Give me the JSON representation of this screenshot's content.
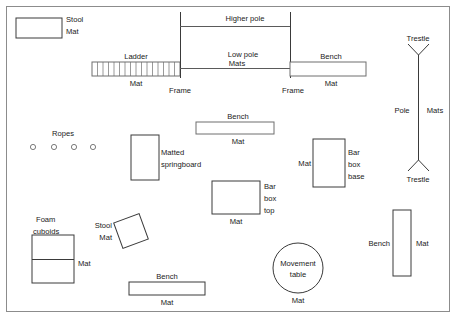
{
  "diagram": {
    "border": {
      "x": 6,
      "y": 6,
      "width": 444,
      "height": 306
    },
    "colors": {
      "outline_dark": "#3a3a3a",
      "outline_soft": "#6e6e6e",
      "border": "#8c8c8c",
      "text": "#1a1a1a",
      "background": "#ffffff"
    },
    "items": [
      {
        "id": "stool-mat-top-left",
        "shape": "rect",
        "labels": [
          "Stool",
          "Mat"
        ],
        "x": 16,
        "y": 18,
        "width": 46,
        "height": 20
      },
      {
        "id": "ladder",
        "shape": "ladder",
        "labels": [
          "Ladder",
          "Mat"
        ],
        "x": 92,
        "y": 62,
        "width": 88,
        "height": 14,
        "rungs": 16
      },
      {
        "id": "frame-left",
        "shape": "vline",
        "labels": [
          "Frame"
        ],
        "x": 180,
        "y1": 12,
        "y2": 76
      },
      {
        "id": "frame-right",
        "shape": "vline",
        "labels": [
          "Frame"
        ],
        "x": 290,
        "y1": 12,
        "y2": 76
      },
      {
        "id": "higher-pole",
        "shape": "hline",
        "labels": [
          "Higher pole"
        ],
        "x1": 180,
        "x2": 290,
        "y": 26
      },
      {
        "id": "low-pole",
        "shape": "hline",
        "labels": [
          "Low pole",
          "Mats"
        ],
        "x1": 180,
        "x2": 290,
        "y": 68
      },
      {
        "id": "bench-mat-top-right",
        "shape": "rect",
        "labels": [
          "Bench",
          "Mat"
        ],
        "x": 290,
        "y": 62,
        "width": 76,
        "height": 14
      },
      {
        "id": "trestle-pole-assembly",
        "shape": "pole-trestle",
        "labels": [
          "Trestle",
          "Pole",
          "Mats",
          "Trestle"
        ],
        "x": 418,
        "y1": 55,
        "y2": 160,
        "arm": 11
      },
      {
        "id": "ropes",
        "shape": "dots",
        "labels": [
          "Ropes"
        ],
        "y": 147,
        "dot_xs": [
          33,
          54,
          74,
          93
        ],
        "radius": 2.6
      },
      {
        "id": "bench-mat-middle",
        "shape": "rect",
        "labels": [
          "Bench",
          "Mat"
        ],
        "x": 196,
        "y": 122,
        "width": 78,
        "height": 12
      },
      {
        "id": "matted-springboard",
        "shape": "rect",
        "labels": [
          "Matted",
          "springboard"
        ],
        "x": 131,
        "y": 135,
        "width": 28,
        "height": 45
      },
      {
        "id": "bar-box-base",
        "shape": "rect",
        "labels": [
          "Mat",
          "Bar",
          "box",
          "base"
        ],
        "x": 313,
        "y": 139,
        "width": 32,
        "height": 48
      },
      {
        "id": "bar-box-top",
        "shape": "rect",
        "labels": [
          "Mat",
          "Bar",
          "box",
          "top"
        ],
        "x": 212,
        "y": 181,
        "width": 48,
        "height": 33
      },
      {
        "id": "foam-cuboids",
        "shape": "rect-split",
        "labels": [
          "Foam",
          "cuboids",
          "Mat"
        ],
        "x": 32,
        "y": 235,
        "width": 42,
        "height": 48,
        "split_y": 259
      },
      {
        "id": "stool-mat-rotated",
        "shape": "rect-rotated",
        "labels": [
          "Stool",
          "Mat"
        ],
        "cx": 131,
        "cy": 231,
        "width": 27,
        "height": 27,
        "rotation": -20
      },
      {
        "id": "bench-mat-bottom",
        "shape": "rect",
        "labels": [
          "Bench",
          "Mat"
        ],
        "x": 129,
        "y": 282,
        "width": 76,
        "height": 13
      },
      {
        "id": "movement-table",
        "shape": "circle",
        "labels": [
          "Movement",
          "table",
          "Mat"
        ],
        "cx": 298,
        "cy": 268,
        "radius": 25
      },
      {
        "id": "bench-mat-right",
        "shape": "rect-vertical",
        "labels": [
          "Bench",
          "Mat"
        ],
        "x": 393,
        "y": 210,
        "width": 18,
        "height": 66
      }
    ],
    "text_labels": [
      {
        "id": "label-stool-tl",
        "text": "Stool",
        "x": 66,
        "y": 22,
        "anchor": "start"
      },
      {
        "id": "label-mat-tl",
        "text": "Mat",
        "x": 66,
        "y": 34,
        "anchor": "start"
      },
      {
        "id": "label-ladder",
        "text": "Ladder",
        "x": 136,
        "y": 59,
        "anchor": "middle"
      },
      {
        "id": "label-mat-ladder",
        "text": "Mat",
        "x": 136,
        "y": 86,
        "anchor": "middle"
      },
      {
        "id": "label-frame-left",
        "text": "Frame",
        "x": 180,
        "y": 93,
        "anchor": "middle"
      },
      {
        "id": "label-higher-pole",
        "text": "Higher pole",
        "x": 245,
        "y": 21,
        "anchor": "middle"
      },
      {
        "id": "label-low-pole",
        "text": "Low pole",
        "x": 243,
        "y": 57,
        "anchor": "middle"
      },
      {
        "id": "label-mats-pole",
        "text": "Mats",
        "x": 237,
        "y": 70,
        "anchor": "middle"
      },
      {
        "id": "label-frame-right",
        "text": "Frame",
        "x": 293,
        "y": 93,
        "anchor": "middle"
      },
      {
        "id": "label-bench-tr",
        "text": "Bench",
        "x": 331,
        "y": 59,
        "anchor": "middle"
      },
      {
        "id": "label-mat-tr",
        "text": "Mat",
        "x": 331,
        "y": 86,
        "anchor": "middle"
      },
      {
        "id": "label-trestle-top",
        "text": "Trestle",
        "x": 418,
        "y": 48,
        "anchor": "middle"
      },
      {
        "id": "label-pole",
        "text": "Pole",
        "x": 403,
        "y": 113,
        "anchor": "middle"
      },
      {
        "id": "label-mats-right",
        "text": "Mats",
        "x": 434,
        "y": 113,
        "anchor": "middle"
      },
      {
        "id": "label-trestle-bottom",
        "text": "Trestle",
        "x": 418,
        "y": 180,
        "anchor": "middle"
      },
      {
        "id": "label-ropes",
        "text": "Ropes",
        "x": 63,
        "y": 136,
        "anchor": "middle"
      },
      {
        "id": "label-bench-mid",
        "text": "Bench",
        "x": 238,
        "y": 119,
        "anchor": "middle"
      },
      {
        "id": "label-mat-mid",
        "text": "Mat",
        "x": 238,
        "y": 144,
        "anchor": "middle"
      },
      {
        "id": "label-matted",
        "text": "Matted",
        "x": 161,
        "y": 155,
        "anchor": "start"
      },
      {
        "id": "label-springboard",
        "text": "springboard",
        "x": 161,
        "y": 167,
        "anchor": "start"
      },
      {
        "id": "label-mat-barbase",
        "text": "Mat",
        "x": 310,
        "y": 166,
        "anchor": "end"
      },
      {
        "id": "label-bar-base1",
        "text": "Bar",
        "x": 348,
        "y": 155,
        "anchor": "start"
      },
      {
        "id": "label-bar-base2",
        "text": "box",
        "x": 348,
        "y": 167,
        "anchor": "start"
      },
      {
        "id": "label-bar-base3",
        "text": "base",
        "x": 348,
        "y": 179,
        "anchor": "start"
      },
      {
        "id": "label-bar-top1",
        "text": "Bar",
        "x": 264,
        "y": 189,
        "anchor": "start"
      },
      {
        "id": "label-bar-top2",
        "text": "box",
        "x": 264,
        "y": 201,
        "anchor": "start"
      },
      {
        "id": "label-bar-top3",
        "text": "top",
        "x": 264,
        "y": 213,
        "anchor": "start"
      },
      {
        "id": "label-mat-bartop",
        "text": "Mat",
        "x": 236,
        "y": 224,
        "anchor": "middle"
      },
      {
        "id": "label-foam1",
        "text": "Foam",
        "x": 36,
        "y": 222,
        "anchor": "start"
      },
      {
        "id": "label-foam2",
        "text": "cuboids",
        "x": 33,
        "y": 234,
        "anchor": "start"
      },
      {
        "id": "label-mat-foam",
        "text": "Mat",
        "x": 78,
        "y": 266,
        "anchor": "start"
      },
      {
        "id": "label-stool-rot",
        "text": "Stool",
        "x": 112,
        "y": 228,
        "anchor": "end"
      },
      {
        "id": "label-mat-rot",
        "text": "Mat",
        "x": 112,
        "y": 240,
        "anchor": "end"
      },
      {
        "id": "label-bench-bottom",
        "text": "Bench",
        "x": 167,
        "y": 279,
        "anchor": "middle"
      },
      {
        "id": "label-mat-bottom",
        "text": "Mat",
        "x": 167,
        "y": 305,
        "anchor": "middle"
      },
      {
        "id": "label-movement",
        "text": "Movement",
        "x": 298,
        "y": 266,
        "anchor": "middle"
      },
      {
        "id": "label-table",
        "text": "table",
        "x": 298,
        "y": 277,
        "anchor": "middle"
      },
      {
        "id": "label-mat-movement",
        "text": "Mat",
        "x": 298,
        "y": 303,
        "anchor": "middle"
      },
      {
        "id": "label-bench-right",
        "text": "Bench",
        "x": 390,
        "y": 246,
        "anchor": "end"
      },
      {
        "id": "label-mat-right",
        "text": "Mat",
        "x": 416,
        "y": 246,
        "anchor": "start"
      }
    ]
  }
}
